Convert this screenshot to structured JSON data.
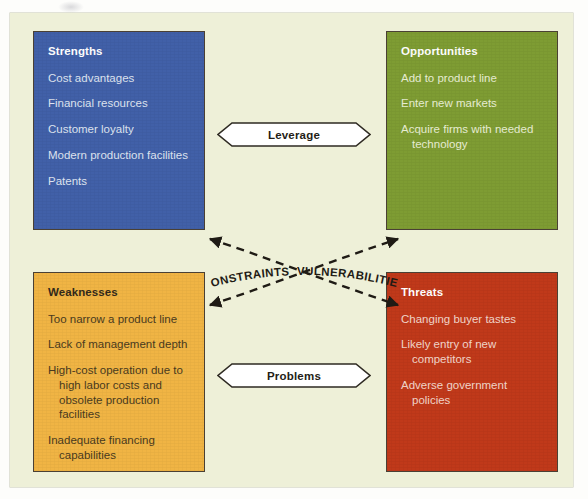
{
  "diagram": {
    "type": "swot-matrix",
    "background_color": "#eef0d8",
    "page_color": "#fdfdfb"
  },
  "quadrants": {
    "strengths": {
      "title": "Strengths",
      "color": "#4160a8",
      "items": [
        "Cost advantages",
        "Financial resources",
        "Customer loyalty",
        "Modern production facilities",
        "Patents"
      ]
    },
    "opportunities": {
      "title": "Opportunities",
      "color": "#7e9c33",
      "items": [
        "Add to product line",
        "Enter new markets",
        "Acquire firms with needed technology"
      ]
    },
    "weaknesses": {
      "title": "Weaknesses",
      "color": "#f0b444",
      "items": [
        "Too narrow a product line",
        "Lack of management depth",
        "High-cost operation due to high labor costs and obsolete production facilities",
        "Inadequate financing capabilities",
        "Weak market image"
      ]
    },
    "threats": {
      "title": "Threats",
      "color": "#c0391a",
      "items": [
        "Changing buyer tastes",
        "Likely entry of new competitors",
        "Adverse government policies"
      ]
    }
  },
  "connectors": {
    "top_banner": "Leverage",
    "bottom_banner": "Problems",
    "cross_label_left": "CONSTRAINTS",
    "cross_label_right": "VULNERABILITIES"
  }
}
